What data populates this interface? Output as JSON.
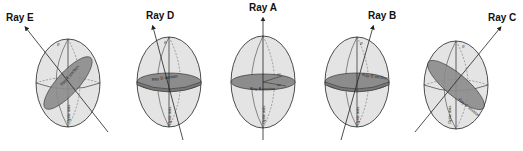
{
  "figure": {
    "colors": {
      "ellipsoid_fill": "#e4e4e4",
      "section_fill": "#8c8c8c",
      "outline": "#222222",
      "dashed": "#555555",
      "background": "#ffffff"
    },
    "panels": [
      {
        "id": "E",
        "ray_label": "Ray E",
        "section_label": "Ray E section",
        "axis_label": "Optic axis",
        "angle_label": "θ",
        "n1": "ε'",
        "n2": "ω"
      },
      {
        "id": "D",
        "ray_label": "Ray D",
        "section_label": "Ray D section",
        "axis_label": "Optic axis",
        "angle_label": "θ",
        "n1": "ε'",
        "n2": "ω"
      },
      {
        "id": "A",
        "ray_label": "Ray A",
        "section_label": "Ray A section",
        "axis_label": "Optic axis",
        "angle_label": "",
        "n1": "ω",
        "n2": "ω"
      },
      {
        "id": "B",
        "ray_label": "Ray B",
        "section_label": "Ray B section",
        "axis_label": "Optic axis",
        "angle_label": "θ",
        "n1": "ε'",
        "n2": "ω"
      },
      {
        "id": "C",
        "ray_label": "Ray C",
        "section_label": "Ray C section",
        "axis_label": "Optic axis",
        "angle_label": "θ",
        "n1": "ε'",
        "n2": "ω"
      }
    ]
  }
}
